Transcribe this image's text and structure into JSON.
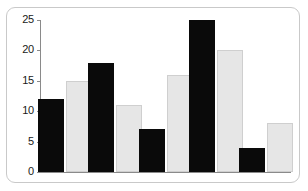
{
  "chart_data": {
    "type": "bar",
    "title": "",
    "subtitle": "",
    "xlabel": "",
    "ylabel": "",
    "categories": [
      "1",
      "2",
      "3",
      "4",
      "5"
    ],
    "series": [
      {
        "name": "Series 1",
        "color": "#0a0a0a",
        "values": [
          12,
          18,
          7,
          25,
          4
        ]
      },
      {
        "name": "Series 2",
        "color": "#e6e6e6",
        "values": [
          15,
          11,
          16,
          20,
          8
        ]
      }
    ],
    "ylim": [
      0,
      25
    ],
    "yticks": [
      0,
      5,
      10,
      15,
      20,
      25
    ],
    "ytick_labels": [
      "0",
      "5",
      "10",
      "15",
      "20",
      "25"
    ],
    "xtick_labels": [
      "",
      "",
      "",
      "",
      ""
    ],
    "grid": false,
    "legend": "none",
    "frame_color": "#c9c9c9",
    "axis_color": "#8a8a8a",
    "background": "#ffffff"
  }
}
